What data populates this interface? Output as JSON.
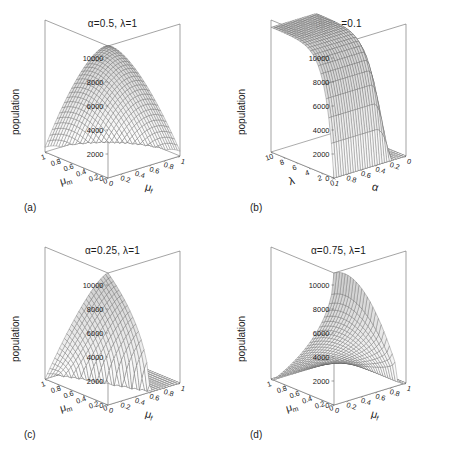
{
  "figure": {
    "background": "#ffffff",
    "line_color": "#555555",
    "axis_color": "#666666",
    "panel_count": 4
  },
  "common": {
    "zlabel": "population",
    "zticks": [
      "0",
      "2000",
      "4000",
      "6000",
      "8000",
      "10000"
    ],
    "zlim": [
      0,
      11000
    ],
    "mu_m_label": "μ",
    "mu_m_sub": "m",
    "mu_f_label": "μ",
    "mu_f_sub": "f",
    "mu_ticks_left": [
      "0.2",
      "0.4",
      "0.6",
      "0.8",
      "1"
    ],
    "mu_ticks_right": [
      "1",
      "0.8",
      "0.6",
      "0.4",
      "0.2",
      "0"
    ]
  },
  "panels": [
    {
      "key": "a",
      "letter": "(a)",
      "title": "α=0.5, λ=1",
      "xlabel": "μ",
      "xsub": "m",
      "ylabel": "μ",
      "ysub": "f",
      "description": "dome-shaped surface peaking at back corner near 11000"
    },
    {
      "key": "b",
      "letter": "(b)",
      "title": "μ_f=μ_m=0.1",
      "title_parts": [
        "μ",
        "f",
        "=",
        "μ",
        "m",
        "=0.1"
      ],
      "xlabel": "λ",
      "ylabel": "α",
      "lambda_ticks": [
        "10",
        "8",
        "6",
        "4",
        "2",
        "0"
      ],
      "alpha_ticks": [
        "0",
        "0.2",
        "0.4",
        "0.6",
        "0.8",
        "1"
      ],
      "description": "broad plateau near 10000 dropping sharply beyond alpha 0.75"
    },
    {
      "key": "c",
      "letter": "(c)",
      "title": "α=0.25, λ=1",
      "xlabel": "μ",
      "xsub": "m",
      "ylabel": "μ",
      "ysub": "f",
      "description": "flat zero plain with steep ridge rising to 11000 at low mu_f"
    },
    {
      "key": "d",
      "letter": "(d)",
      "title": "α=0.75, λ=1",
      "xlabel": "μ",
      "xsub": "m",
      "ylabel": "μ",
      "ysub": "f",
      "description": "high wall at low mu_m sloping down to zero at high mu_f"
    }
  ],
  "chart_data": [
    {
      "type": "surface",
      "panel": "a",
      "title": "α=0.5, λ=1",
      "xlabel": "μ_m",
      "ylabel": "μ_f",
      "zlabel": "population",
      "xlim": [
        0,
        1
      ],
      "ylim": [
        0,
        1
      ],
      "zlim": [
        0,
        11000
      ],
      "zticks": [
        0,
        2000,
        4000,
        6000,
        8000,
        10000
      ],
      "xticks": [
        0.2,
        0.4,
        0.6,
        0.8,
        1
      ],
      "yticks": [
        1,
        0.8,
        0.6,
        0.4,
        0.2,
        0
      ],
      "peak_value": 11000,
      "peak_at": {
        "mu_m": 0.05,
        "mu_f": 0.05
      },
      "z_grid_note": "smooth dome, monotonically decreasing with both mu_m and mu_f, zero near mu=1"
    },
    {
      "type": "surface",
      "panel": "b",
      "title": "μ_f=μ_m=0.1",
      "xlabel": "λ",
      "ylabel": "α",
      "zlabel": "population",
      "xlim": [
        0,
        10
      ],
      "ylim": [
        0,
        1
      ],
      "zlim": [
        0,
        11000
      ],
      "zticks": [
        0,
        2000,
        4000,
        6000,
        8000,
        10000
      ],
      "xticks": [
        10,
        8,
        6,
        4,
        2,
        0
      ],
      "yticks": [
        0,
        0.2,
        0.4,
        0.6,
        0.8,
        1
      ],
      "plateau_value": 10000,
      "cutoff_alpha": 0.75,
      "z_grid_note": "plateau near 10000 for lambda>1 and alpha<0.7, collapses to 0 past alpha 0.8"
    },
    {
      "type": "surface",
      "panel": "c",
      "title": "α=0.25, λ=1",
      "xlabel": "μ_m",
      "ylabel": "μ_f",
      "zlabel": "population",
      "xlim": [
        0,
        1
      ],
      "ylim": [
        0,
        1
      ],
      "zlim": [
        0,
        11000
      ],
      "zticks": [
        0,
        2000,
        4000,
        6000,
        8000,
        10000
      ],
      "xticks": [
        0.2,
        0.4,
        0.6,
        0.8,
        1
      ],
      "yticks": [
        1,
        0.8,
        0.6,
        0.4,
        0.2,
        0
      ],
      "peak_value": 11000,
      "peak_at": {
        "mu_m": 0.05,
        "mu_f": 0.05
      },
      "z_grid_note": "zero for mu_f>0.55, sharp cliff up to peak at low mu_f"
    },
    {
      "type": "surface",
      "panel": "d",
      "title": "α=0.75, λ=1",
      "xlabel": "μ_m",
      "ylabel": "μ_f",
      "zlabel": "population",
      "xlim": [
        0,
        1
      ],
      "ylim": [
        0,
        1
      ],
      "zlim": [
        0,
        11000
      ],
      "zticks": [
        0,
        2000,
        4000,
        6000,
        8000,
        10000
      ],
      "xticks": [
        0.2,
        0.4,
        0.6,
        0.8,
        1
      ],
      "yticks": [
        1,
        0.8,
        0.6,
        0.4,
        0.2,
        0
      ],
      "peak_value": 11000,
      "peak_at": {
        "mu_m": 0.05,
        "mu_f": 0.05
      },
      "z_grid_note": "steep wall at low mu_m reaching 11000, decaying to 0 by mu_f 0.8"
    }
  ]
}
